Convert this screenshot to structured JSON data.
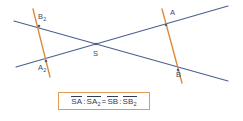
{
  "diagram": {
    "colors": {
      "ray_blue": "#4a5f8e",
      "transversal_orange": "#e08a3c",
      "label_text": "#3c4a6b",
      "box_border": "#e09a54",
      "background": "#ffffff"
    },
    "vertex": {
      "name": "S",
      "label": "S",
      "x": 96,
      "y": 44
    },
    "rays": [
      {
        "name": "ray-upper-left-to-lower-right",
        "from": {
          "x": 14,
          "y": 21
        },
        "to": {
          "x": 228,
          "y": 81
        }
      },
      {
        "name": "ray-lower-left-to-upper-right",
        "from": {
          "x": 16,
          "y": 67
        },
        "to": {
          "x": 228,
          "y": 6
        }
      }
    ],
    "transversals": [
      {
        "name": "left-transversal",
        "from": {
          "x": 33,
          "y": 9
        },
        "to": {
          "x": 50,
          "y": 77
        }
      },
      {
        "name": "right-transversal",
        "from": {
          "x": 162,
          "y": 9
        },
        "to": {
          "x": 182,
          "y": 83
        }
      }
    ],
    "points": [
      {
        "id": "B2",
        "base": "B",
        "sub": "2",
        "x": 39,
        "y": 26,
        "label_x": 38,
        "label_y": 13
      },
      {
        "id": "A2",
        "base": "A",
        "sub": "2",
        "x": 46,
        "y": 61,
        "label_x": 38,
        "label_y": 64
      },
      {
        "id": "A",
        "base": "A",
        "sub": "",
        "x": 166,
        "y": 25,
        "label_x": 170,
        "label_y": 9
      },
      {
        "id": "B",
        "base": "B",
        "sub": "",
        "x": 178,
        "y": 70,
        "label_x": 176,
        "label_y": 71
      }
    ]
  },
  "formula": {
    "full_text": "SA : SA₂ = SB : SB₂",
    "terms": [
      {
        "base": "SA",
        "sub": ""
      },
      {
        "base": "SA",
        "sub": "2"
      },
      {
        "base": "SB",
        "sub": ""
      },
      {
        "base": "SB",
        "sub": "2"
      }
    ],
    "ratio_separator": ":",
    "equals_sign": "="
  }
}
